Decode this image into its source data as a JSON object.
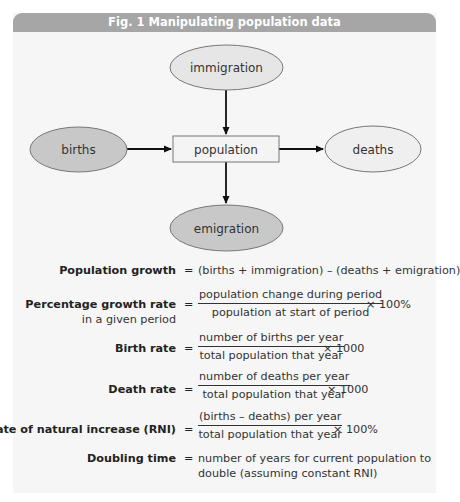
{
  "figure": {
    "title": "Fig. 1  Manipulating population data",
    "colors": {
      "header_bg": "#a6a6a6",
      "panel_bg": "#f6f6f6",
      "inflow_fill": "#c8c8c8",
      "outflow_fill": "#e6e6e6",
      "box_fill": "#f4f4f4",
      "stroke": "#777777"
    }
  },
  "diagram": {
    "center": {
      "label": "population"
    },
    "nodes": [
      {
        "id": "immigration",
        "label": "immigration",
        "position": "top",
        "flow": "into population"
      },
      {
        "id": "births",
        "label": "births",
        "position": "left",
        "flow": "into population"
      },
      {
        "id": "deaths",
        "label": "deaths",
        "position": "right",
        "flow": "out of population"
      },
      {
        "id": "emigration",
        "label": "emigration",
        "position": "bottom",
        "flow": "out of population"
      }
    ]
  },
  "formulas": {
    "population_growth": {
      "label": "Population growth",
      "eq": "=",
      "expression": "(births + immigration) – (deaths + emigration)"
    },
    "percentage_growth_rate": {
      "label": "Percentage growth rate",
      "sublabel": "in a given period",
      "eq": "=",
      "numerator": "population change during period",
      "denominator": "population at start of period",
      "multiplier": "×  100%"
    },
    "birth_rate": {
      "label": "Birth rate",
      "eq": "=",
      "numerator": "number of births per year",
      "denominator": "total population that year",
      "multiplier": "×  1000"
    },
    "death_rate": {
      "label": "Death rate",
      "eq": "=",
      "numerator": "number of deaths per year",
      "denominator": "total population that year",
      "multiplier": "×  1000"
    },
    "rni": {
      "label": "Rate of natural increase (RNI)",
      "eq": "=",
      "numerator": "(births – deaths) per year",
      "denominator": "total population that year",
      "multiplier": "×  100%"
    },
    "doubling_time": {
      "label": "Doubling time",
      "eq": "=",
      "line1": "number of years for current population to",
      "line2": "double (assuming constant RNI)"
    }
  }
}
